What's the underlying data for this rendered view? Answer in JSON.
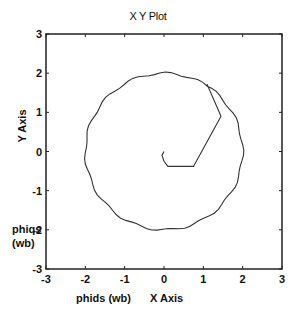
{
  "chart_data": {
    "type": "line",
    "title": "X Y Plot",
    "xlabel": "X Axis",
    "ylabel": "Y Axis",
    "annotations": [
      "phids (wb)",
      "phiqs (wb)"
    ],
    "xlim": [
      -3,
      3
    ],
    "ylim": [
      -3,
      3
    ],
    "xticks": [
      -3,
      -2,
      -1,
      0,
      1,
      2,
      3
    ],
    "yticks": [
      -3,
      -2,
      -1,
      0,
      1,
      2,
      3
    ],
    "grid": false,
    "legend": null,
    "series": [
      {
        "name": "stator flux trajectory",
        "description": "Starts near origin, hooks to the right, climbs to the circle near (1.1, 1.7), then traces a circle of radius ~2 centered at origin",
        "x": [
          0.0,
          -0.05,
          0.0,
          0.1,
          0.75,
          1.45,
          1.1,
          0.6,
          0.0,
          -0.6,
          -1.1,
          -1.45,
          -1.75,
          -1.95,
          -2.0,
          -1.9,
          -1.6,
          -1.2,
          -0.6,
          0.0,
          0.6,
          1.2,
          1.6,
          1.9,
          2.0,
          1.95,
          1.75,
          1.45,
          1.1
        ],
        "y": [
          0.0,
          -0.1,
          -0.25,
          -0.38,
          -0.38,
          0.9,
          1.7,
          1.95,
          2.02,
          1.93,
          1.7,
          1.4,
          1.0,
          0.5,
          0.0,
          -0.6,
          -1.1,
          -1.55,
          -1.88,
          -2.02,
          -1.92,
          -1.6,
          -1.2,
          -0.6,
          0.0,
          0.5,
          1.0,
          1.4,
          1.7
        ]
      }
    ]
  },
  "labels": {
    "title": "X Y Plot",
    "xlabel": "X Axis",
    "ylabel": "Y Axis",
    "phids": "phids (wb)",
    "phiqs_line1": "phiqs",
    "phiqs_line2": "(wb)"
  }
}
